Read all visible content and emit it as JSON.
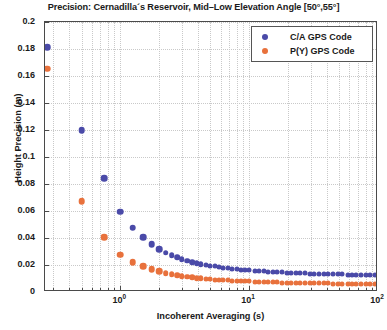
{
  "chart_data": {
    "type": "scatter",
    "title": "Precision: Cernadilla´s Reservoir, Mid–Low Elevation Angle [50°,55°]",
    "xlabel": "Incoherent Averaging (s)",
    "ylabel": "Height Precision (m)",
    "xscale": "log",
    "yscale": "linear",
    "xlim": [
      0.26,
      100
    ],
    "ylim": [
      0,
      0.2
    ],
    "grid": true,
    "legend_position": "top-right",
    "x_tick_labels": [
      "10",
      "10",
      "10"
    ],
    "x_tick_exponents": [
      "0",
      "1",
      "2"
    ],
    "x_tick_values": [
      1,
      10,
      100
    ],
    "y_tick_labels": [
      "0",
      "0.02",
      "0.04",
      "0.06",
      "0.08",
      "0.1",
      "0.12",
      "0.14",
      "0.16",
      "0.18",
      "0.2"
    ],
    "y_tick_values": [
      0,
      0.02,
      0.04,
      0.06,
      0.08,
      0.1,
      0.12,
      0.14,
      0.16,
      0.18,
      0.2
    ],
    "colors": {
      "ca_gps": "#4a4aa8",
      "py_gps": "#e8713c"
    },
    "series": [
      {
        "name": "C/A GPS Code",
        "color": "#4a4aa8",
        "x": [
          0.27,
          0.5,
          0.75,
          1.0,
          1.25,
          1.5,
          1.75,
          2.0,
          2.25,
          2.5,
          2.75,
          3.0,
          3.3,
          3.6,
          3.9,
          4.2,
          4.6,
          5.0,
          5.4,
          5.8,
          6.3,
          6.8,
          7.4,
          8.0,
          8.6,
          9.3,
          10.0,
          11.0,
          12.0,
          13.0,
          14.0,
          15.2,
          16.5,
          18.0,
          19.5,
          21.0,
          23.0,
          25.0,
          27.0,
          29.5,
          32.0,
          35.0,
          38.0,
          41.0,
          45.0,
          49.0,
          53.0,
          58.0,
          63.0,
          68.0,
          74.0,
          80.0,
          87.0,
          94.0,
          100.0
        ],
        "y": [
          0.1815,
          0.12,
          0.0845,
          0.0595,
          0.0475,
          0.0405,
          0.0355,
          0.0318,
          0.0292,
          0.0272,
          0.0256,
          0.0243,
          0.0231,
          0.0222,
          0.0214,
          0.0207,
          0.02,
          0.0194,
          0.0189,
          0.0185,
          0.018,
          0.0176,
          0.0172,
          0.0169,
          0.0166,
          0.0163,
          0.016,
          0.0157,
          0.0155,
          0.0153,
          0.0151,
          0.0149,
          0.0147,
          0.0145,
          0.0144,
          0.0142,
          0.0141,
          0.0139,
          0.0138,
          0.0137,
          0.0136,
          0.0135,
          0.0134,
          0.0133,
          0.0132,
          0.0131,
          0.013,
          0.0129,
          0.0128,
          0.0128,
          0.0127,
          0.0126,
          0.0126,
          0.0125,
          0.0125
        ]
      },
      {
        "name": "P(Y) GPS Code",
        "color": "#e8713c",
        "x": [
          0.27,
          0.5,
          0.75,
          1.0,
          1.25,
          1.5,
          1.75,
          2.0,
          2.25,
          2.5,
          2.75,
          3.0,
          3.3,
          3.6,
          3.9,
          4.2,
          4.6,
          5.0,
          5.4,
          5.8,
          6.3,
          6.8,
          7.4,
          8.0,
          8.6,
          9.3,
          10.0,
          11.0,
          12.0,
          13.0,
          14.0,
          15.2,
          16.5,
          18.0,
          19.5,
          21.0,
          23.0,
          25.0,
          27.0,
          29.5,
          32.0,
          35.0,
          38.0,
          41.0,
          45.0,
          49.0,
          53.0,
          58.0,
          63.0,
          68.0,
          74.0,
          80.0,
          87.0,
          94.0,
          100.0
        ],
        "y": [
          0.1655,
          0.0672,
          0.0408,
          0.0277,
          0.0222,
          0.019,
          0.0168,
          0.0152,
          0.014,
          0.0131,
          0.0124,
          0.0118,
          0.0112,
          0.0108,
          0.0104,
          0.0101,
          0.0098,
          0.0095,
          0.0092,
          0.009,
          0.0088,
          0.0086,
          0.0084,
          0.0082,
          0.0081,
          0.0079,
          0.0078,
          0.0076,
          0.0075,
          0.0074,
          0.0073,
          0.0072,
          0.0071,
          0.007,
          0.0069,
          0.0068,
          0.0067,
          0.0066,
          0.0066,
          0.0065,
          0.0064,
          0.0064,
          0.0063,
          0.0063,
          0.0062,
          0.0062,
          0.0061,
          0.0061,
          0.006,
          0.006,
          0.0059,
          0.0059,
          0.0059,
          0.0058,
          0.0058
        ]
      }
    ]
  },
  "legend": {
    "items": [
      {
        "label": "C/A GPS Code",
        "color": "#4a4aa8"
      },
      {
        "label": "P(Y) GPS Code",
        "color": "#e8713c"
      }
    ]
  }
}
